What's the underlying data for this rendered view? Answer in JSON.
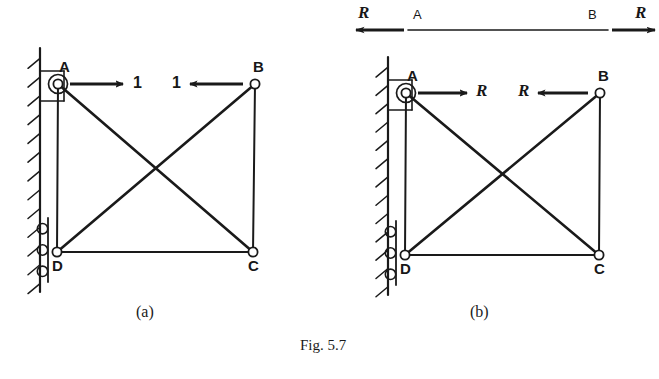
{
  "figure": {
    "caption": "Fig. 5.7",
    "caption_x": 300,
    "caption_y": 337,
    "background": "#ffffff",
    "ink_color": "#1a1a1a"
  },
  "panels": [
    {
      "id": "a",
      "sub_caption": "(a)",
      "sub_caption_x": 136,
      "sub_caption_y": 303,
      "nodes": [
        {
          "name": "A",
          "x": 58,
          "y": 84,
          "label": "A",
          "label_x": 59,
          "label_y": 59
        },
        {
          "name": "B",
          "x": 255,
          "y": 84,
          "label": "B",
          "label_x": 253,
          "label_y": 59
        },
        {
          "name": "C",
          "x": 253,
          "y": 252,
          "label": "C",
          "label_x": 248,
          "label_y": 258
        },
        {
          "name": "D",
          "x": 57,
          "y": 252,
          "label": "D",
          "label_x": 52,
          "label_y": 258
        }
      ],
      "members": [
        {
          "from": "A",
          "to": "D",
          "kind": "chord-vertical-left"
        },
        {
          "from": "B",
          "to": "C",
          "kind": "chord-vertical-right"
        },
        {
          "from": "D",
          "to": "C",
          "kind": "chord-bottom"
        },
        {
          "from": "A",
          "to": "C",
          "kind": "diagonal"
        },
        {
          "from": "D",
          "to": "B",
          "kind": "diagonal"
        }
      ],
      "forces": [
        {
          "at": "A",
          "label": "1",
          "direction": "right",
          "tail_x": 70,
          "tail_y": 84,
          "head_x": 123,
          "head_y": 84,
          "label_x": 133,
          "label_y": 75,
          "italic": false
        },
        {
          "at": "B",
          "label": "1",
          "direction": "left",
          "tail_x": 243,
          "tail_y": 84,
          "head_x": 190,
          "head_y": 84,
          "label_x": 172,
          "label_y": 75,
          "italic": false
        }
      ],
      "supports": {
        "wall": {
          "x": 40,
          "y_top": 48,
          "y_bottom": 292,
          "hatch_count": 13
        },
        "pin": {
          "node": "A",
          "bracket_left": 40,
          "bracket_top": 71,
          "bracket_right": 64,
          "bracket_bottom": 101
        },
        "roller": {
          "node": "D",
          "plate_x": 48,
          "plate_top": 218,
          "plate_bottom": 282,
          "roller_count": 3
        }
      }
    },
    {
      "id": "b",
      "sub_caption": "(b)",
      "sub_caption_x": 470,
      "sub_caption_y": 303,
      "nodes": [
        {
          "name": "A",
          "x": 406,
          "y": 93,
          "label": "A",
          "label_x": 407,
          "label_y": 68
        },
        {
          "name": "B",
          "x": 600,
          "y": 93,
          "label": "B",
          "label_x": 598,
          "label_y": 68
        },
        {
          "name": "C",
          "x": 599,
          "y": 255,
          "label": "C",
          "label_x": 594,
          "label_y": 261
        },
        {
          "name": "D",
          "x": 405,
          "y": 255,
          "label": "D",
          "label_x": 400,
          "label_y": 261
        }
      ],
      "members": [
        {
          "from": "A",
          "to": "D",
          "kind": "chord-vertical-left"
        },
        {
          "from": "B",
          "to": "C",
          "kind": "chord-vertical-right"
        },
        {
          "from": "D",
          "to": "C",
          "kind": "chord-bottom"
        },
        {
          "from": "A",
          "to": "C",
          "kind": "diagonal"
        },
        {
          "from": "D",
          "to": "B",
          "kind": "diagonal"
        }
      ],
      "forces": [
        {
          "at": "A",
          "label": "R",
          "direction": "right",
          "tail_x": 418,
          "tail_y": 93,
          "head_x": 467,
          "head_y": 93,
          "label_x": 476,
          "label_y": 82,
          "italic": true
        },
        {
          "at": "B",
          "label": "R",
          "direction": "left",
          "tail_x": 588,
          "tail_y": 93,
          "head_x": 538,
          "head_y": 93,
          "label_x": 518,
          "label_y": 82,
          "italic": true
        }
      ],
      "supports": {
        "wall": {
          "x": 388,
          "y_top": 57,
          "y_bottom": 295,
          "hatch_count": 13
        },
        "pin": {
          "node": "A",
          "bracket_left": 388,
          "bracket_top": 80,
          "bracket_right": 412,
          "bracket_bottom": 110
        },
        "roller": {
          "node": "D",
          "plate_x": 396,
          "plate_top": 221,
          "plate_bottom": 285,
          "roller_count": 3
        }
      },
      "free_body": {
        "line_x1": 408,
        "line_x2": 608,
        "line_y": 30,
        "point_a": {
          "label": "A",
          "x": 413,
          "y": 8
        },
        "point_b": {
          "label": "B",
          "x": 588,
          "y": 8
        },
        "left_force": {
          "label": "R",
          "label_x": 358,
          "label_y": 4,
          "tail_x": 404,
          "head_x": 356,
          "y": 30,
          "direction": "left"
        },
        "right_force": {
          "label": "R",
          "label_x": 635,
          "label_y": 4,
          "tail_x": 612,
          "head_x": 655,
          "y": 30,
          "direction": "right"
        }
      }
    }
  ]
}
